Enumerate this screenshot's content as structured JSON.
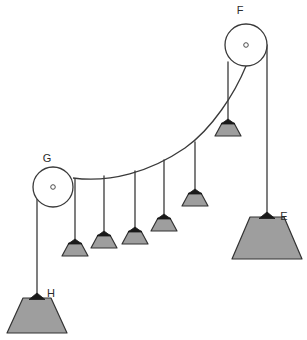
{
  "diagram": {
    "background_color": "#ffffff",
    "stroke_color": "#3a3a3a",
    "weight_fill": "#9e9e9e",
    "weight_stroke": "#333333",
    "cap_fill": "#1a1a1a",
    "pulley_fill": "#ffffff",
    "pulley_stroke": "#3a3a3a",
    "labels": {
      "pulley_top_right": "F",
      "pulley_left": "G",
      "weight_right": "E",
      "weight_left": "H"
    },
    "pulleys": [
      {
        "name": "F",
        "cx": 246,
        "cy": 45,
        "r": 21,
        "hub_r": 2.3,
        "label": "F",
        "label_x": 240,
        "label_y": 14
      },
      {
        "name": "G",
        "cx": 53,
        "cy": 187,
        "r": 20,
        "hub_r": 2.3,
        "label": "G",
        "label_x": 47,
        "label_y": 162
      }
    ],
    "large_weights": [
      {
        "name": "E",
        "apex_x": 267,
        "apex_y": 212,
        "top_y": 217,
        "base_y": 259,
        "top_half_w": 17,
        "base_half_w": 35,
        "label": "E",
        "label_x": 284,
        "label_y": 220
      },
      {
        "name": "H",
        "apex_x": 37,
        "apex_y": 293,
        "top_y": 298,
        "base_y": 333,
        "top_half_w": 14,
        "base_half_w": 30,
        "label": "H",
        "label_x": 51,
        "label_y": 297
      }
    ],
    "small_weights": [
      {
        "index": 1,
        "x": 75,
        "cord_top_y": 179,
        "apex_y": 240,
        "top_y": 243,
        "base_y": 256,
        "top_half_w": 6,
        "base_half_w": 13
      },
      {
        "index": 2,
        "x": 104,
        "cord_top_y": 176,
        "apex_y": 232,
        "top_y": 235,
        "base_y": 248,
        "top_half_w": 6,
        "base_half_w": 13
      },
      {
        "index": 3,
        "x": 135,
        "cord_top_y": 171,
        "apex_y": 228,
        "top_y": 231,
        "base_y": 244,
        "top_half_w": 6,
        "base_half_w": 13
      },
      {
        "index": 4,
        "x": 164,
        "cord_top_y": 160,
        "apex_y": 215,
        "top_y": 218,
        "base_y": 231,
        "top_half_w": 6,
        "base_half_w": 13
      },
      {
        "index": 5,
        "x": 195,
        "cord_top_y": 142,
        "apex_y": 190,
        "top_y": 193,
        "base_y": 206,
        "top_half_w": 6,
        "base_half_w": 13
      },
      {
        "index": 6,
        "x": 228,
        "cord_top_y": 103,
        "apex_y": 120,
        "top_y": 123,
        "base_y": 136,
        "top_half_w": 6,
        "base_half_w": 13
      }
    ],
    "cable": {
      "description": "catenary cable from pulley G rim to pulley F rim",
      "path": "M 73 178 C 110 183 150 172 185 148 C 212 129 235 93 246 66"
    },
    "cords": [
      {
        "name": "cord-E",
        "from_x": 267,
        "from_y": 45,
        "to_x": 267,
        "to_y": 214
      },
      {
        "name": "cord-H",
        "from_x": 37,
        "from_y": 187,
        "to_x": 37,
        "to_y": 295
      },
      {
        "name": "cord-F-to-weight6",
        "from_x": 228,
        "from_y": 62,
        "to_x": 228,
        "to_y": 122
      }
    ],
    "stroke_widths": {
      "cable": 1.3,
      "cord": 1.3,
      "pulley": 1.3,
      "weight": 1.2
    }
  }
}
